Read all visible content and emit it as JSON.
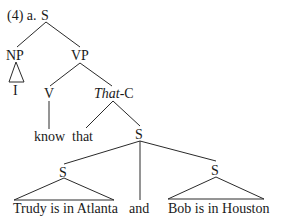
{
  "example_label": "(4) a.",
  "tree": {
    "root": "S",
    "np": "NP",
    "np_leaf": "I",
    "vp": "VP",
    "v": "V",
    "v_leaf": "know",
    "that_c_italic": "That",
    "that_c_suffix": "-C",
    "comp_leaf": "that",
    "s_coord": "S",
    "s_left": "S",
    "s_left_leaf": "Trudy is in Atlanta",
    "conj": "and",
    "s_right": "S",
    "s_right_leaf": "Bob is in Houston"
  }
}
